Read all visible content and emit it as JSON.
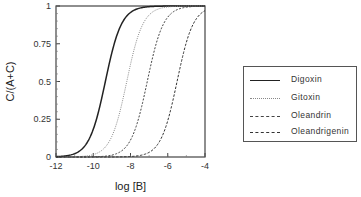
{
  "chart_data": {
    "type": "line",
    "title": "",
    "xlabel": "log [B]",
    "ylabel": "C/(A+C)",
    "xlim": [
      -12,
      -4
    ],
    "ylim": [
      0,
      1
    ],
    "x_ticks": [
      -12,
      -10,
      -8,
      -6,
      -4
    ],
    "x_tick_labels": [
      "-12",
      "-10",
      "-8",
      "-6",
      "-4"
    ],
    "y_ticks": [
      0,
      0.25,
      0.5,
      0.75,
      1
    ],
    "y_tick_labels": [
      "0",
      "0.25",
      "0.5",
      "0.75",
      "1"
    ],
    "grid": false,
    "legend_position": "right",
    "series": [
      {
        "name": "Digoxin",
        "style": "solid",
        "midpoint_logB": -9.35,
        "x": [
          -12,
          -11,
          -10.5,
          -10,
          -9.5,
          -9.35,
          -9,
          -8.5,
          -8,
          -7.5
        ],
        "values": [
          0.0,
          0.03,
          0.12,
          0.32,
          0.45,
          0.5,
          0.75,
          0.95,
          0.99,
          1.0
        ]
      },
      {
        "name": "Gitoxin",
        "style": "dotted",
        "midpoint_logB": -8.2,
        "x": [
          -12,
          -10,
          -9.5,
          -9,
          -8.5,
          -8.2,
          -8,
          -7.5,
          -7,
          -6.5
        ],
        "values": [
          0.0,
          0.01,
          0.05,
          0.15,
          0.32,
          0.5,
          0.65,
          0.88,
          0.97,
          1.0
        ]
      },
      {
        "name": "Oleandrin",
        "style": "dashed-fine",
        "midpoint_logB": -7.1,
        "x": [
          -12,
          -9,
          -8.5,
          -8,
          -7.5,
          -7.1,
          -6.5,
          -6,
          -5.5,
          -5
        ],
        "values": [
          0.0,
          0.01,
          0.04,
          0.12,
          0.3,
          0.5,
          0.78,
          0.92,
          0.98,
          1.0
        ]
      },
      {
        "name": "Oleandrigenin",
        "style": "dashed",
        "midpoint_logB": -5.5,
        "x": [
          -12,
          -7.5,
          -7,
          -6.5,
          -6,
          -5.5,
          -5,
          -4.5,
          -4
        ],
        "values": [
          0.0,
          0.01,
          0.03,
          0.1,
          0.27,
          0.5,
          0.75,
          0.9,
          0.97
        ]
      }
    ]
  },
  "legend": {
    "items": [
      {
        "label": "Digoxin"
      },
      {
        "label": "Gitoxin"
      },
      {
        "label": "Oleandrin"
      },
      {
        "label": "Oleandrigenin"
      }
    ]
  }
}
